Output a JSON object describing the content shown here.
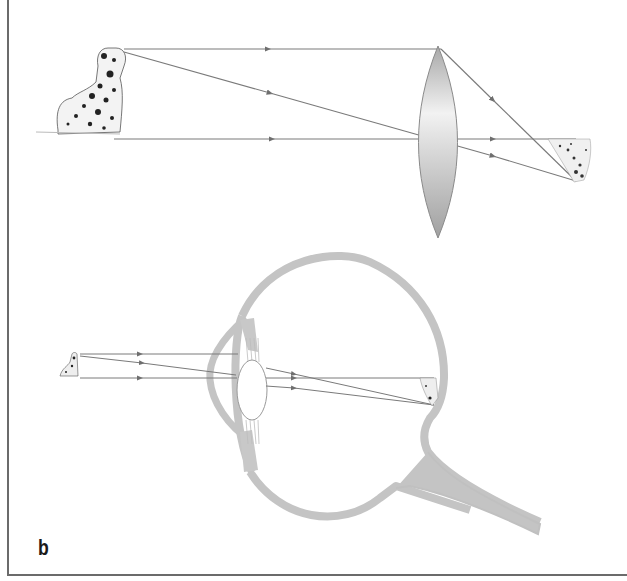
{
  "figure": {
    "panel_label": "b",
    "colors": {
      "ray": "#7a7a7a",
      "arrowhead": "#6e6e6e",
      "eye_tissue": "#c4c4c4",
      "lens_outline": "#8a8a8a",
      "border": "#6b6b6b",
      "label": "#1a1a1a"
    },
    "top_diagram": {
      "description": "Converging lens forming an inverted real image of a dalmatian",
      "object": "dalmatian-dog",
      "optic": "biconvex-lens",
      "image": "inverted-dalmatian",
      "rays": 3
    },
    "bottom_diagram": {
      "description": "Human eye forming an inverted image on the retina",
      "object": "small-dalmatian",
      "optic": "eye-lens",
      "image": "inverted-image-on-retina",
      "rays": 3,
      "parts": [
        "cornea",
        "iris",
        "ciliary-body",
        "lens",
        "eyeball-wall",
        "optic-nerve"
      ]
    }
  }
}
